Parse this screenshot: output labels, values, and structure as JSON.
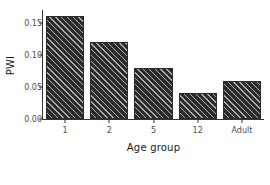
{
  "chart_data": {
    "type": "bar",
    "title": "",
    "subtitle": "",
    "xlabel": "Age group",
    "ylabel": "PWI",
    "categories": [
      "1",
      "2",
      "5",
      "12",
      "Adult"
    ],
    "values": [
      0.16,
      0.12,
      0.08,
      0.04,
      0.06
    ],
    "series": [
      {
        "name": "PWI",
        "values": [
          0.16,
          0.12,
          0.08,
          0.04,
          0.06
        ]
      }
    ],
    "ylim": [
      0.0,
      0.17
    ],
    "xlim_categorical": true,
    "y_ticks": [
      0.0,
      0.05,
      0.1,
      0.15
    ],
    "y_tick_labels": [
      "0.00",
      "0.05",
      "0.10",
      "0.15"
    ],
    "x_tick_labels": [
      "1",
      "2",
      "5",
      "12",
      "Adult"
    ],
    "grid": false,
    "legend": false,
    "legend_position": "none",
    "annotations": [],
    "bar_fill_color": "#2b2b2b",
    "bar_hatch_pattern": "diagonal-up-right",
    "bar_hatch_color": "#e1e1e1",
    "axis_line_color": "#333333",
    "tick_label_color": "#4d4d4d",
    "axis_title_color": "#1a1a1a",
    "background_color": "#ffffff"
  }
}
